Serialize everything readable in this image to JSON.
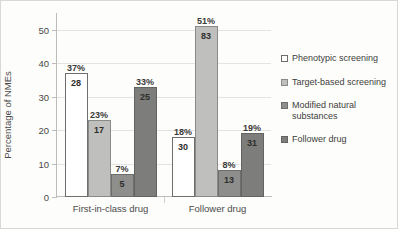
{
  "chart_data": {
    "type": "bar",
    "title": "",
    "xlabel": "",
    "ylabel": "Percentage of NMEs",
    "ylim": [
      0,
      55
    ],
    "yticks": [
      0,
      10,
      20,
      30,
      40,
      50
    ],
    "ytick_labels": [
      "0",
      "10",
      "20",
      "30",
      "40",
      "50"
    ],
    "grid": true,
    "legend_position": "right",
    "categories": [
      "First-in-class drug",
      "Follower drug"
    ],
    "series": [
      {
        "name": "Phenotypic screening",
        "color": "#ffffff",
        "border": "#6e6e6c",
        "values": [
          37,
          18
        ],
        "pct_labels": [
          "37%",
          "18%"
        ],
        "count_labels": [
          "28",
          "30"
        ]
      },
      {
        "name": "Target-based screening",
        "color": "#bfbfbd",
        "border": "#8a8a88",
        "values": [
          23,
          51
        ],
        "pct_labels": [
          "23%",
          "51%"
        ],
        "count_labels": [
          "17",
          "83"
        ]
      },
      {
        "name": "Modified natural substances",
        "color": "#8e8e8c",
        "border": "#6e6e6c",
        "values": [
          7,
          8
        ],
        "pct_labels": [
          "7%",
          "8%"
        ],
        "count_labels": [
          "5",
          "13"
        ]
      },
      {
        "name": "Follower drug",
        "color": "#7d7d7b",
        "border": "#636361",
        "values": [
          33,
          19
        ],
        "pct_labels": [
          "33%",
          "19%"
        ],
        "count_labels": [
          "25",
          "31"
        ]
      }
    ]
  }
}
